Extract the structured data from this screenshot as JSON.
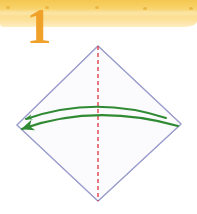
{
  "banner": {
    "label": "",
    "fill_top": "#f3c751",
    "fill_bottom": "#fdeec2",
    "dot_color": "#e9b23c",
    "dots": [
      {
        "x": 6,
        "y": 6
      },
      {
        "x": 45,
        "y": 6
      },
      {
        "x": 95,
        "y": 6
      },
      {
        "x": 143,
        "y": 7
      },
      {
        "x": 189,
        "y": 7
      }
    ]
  },
  "step": {
    "number": "1",
    "color": "#f0a12a"
  },
  "diagram": {
    "type": "origami-fold-step",
    "shape_name": "square-rotated-45",
    "outline_color": "#9a9ccc",
    "outline_width": 1,
    "vertices": {
      "top": {
        "x": 98,
        "y": 46
      },
      "right": {
        "x": 181,
        "y": 124
      },
      "bottom": {
        "x": 98,
        "y": 201
      },
      "left": {
        "x": 17,
        "y": 125
      }
    },
    "fold_line": {
      "name": "vertical-fold-line",
      "style": "dashed",
      "color": "#e0404a",
      "width": 1.4,
      "dash": "4 3",
      "from": {
        "x": 98,
        "y": 46
      },
      "to": {
        "x": 98,
        "y": 201
      }
    },
    "arrows": [
      {
        "name": "fold-arrow-upper",
        "color": "#2f8a33",
        "width": 2,
        "from": {
          "x": 166,
          "y": 118
        },
        "control": {
          "x": 95,
          "y": 95
        },
        "to": {
          "x": 26,
          "y": 119
        },
        "arrowhead": "small"
      },
      {
        "name": "fold-arrow-lower",
        "color": "#2f8a33",
        "width": 2.2,
        "from": {
          "x": 178,
          "y": 126
        },
        "control": {
          "x": 95,
          "y": 103
        },
        "to": {
          "x": 22,
          "y": 129
        },
        "arrowhead": "large"
      }
    ]
  }
}
